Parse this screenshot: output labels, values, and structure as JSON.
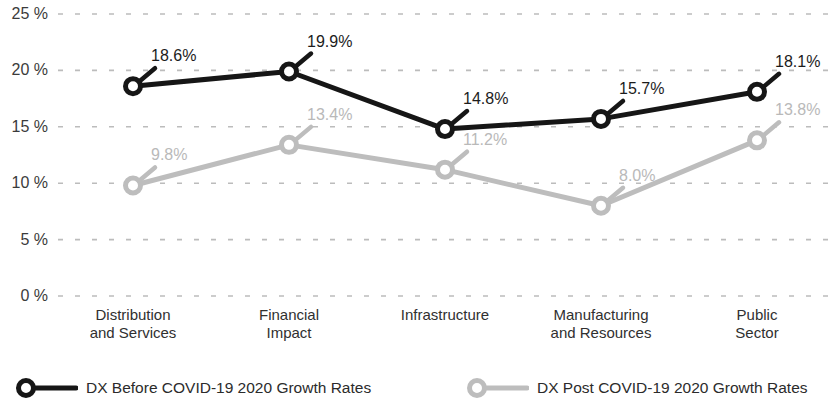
{
  "chart_data": {
    "type": "line",
    "title": "",
    "subtitle": "",
    "xlabel": "",
    "ylabel": "",
    "ylim": [
      0,
      25
    ],
    "yticks": [
      0,
      5,
      10,
      15,
      20,
      25
    ],
    "ytick_labels": [
      "0 %",
      "5 %",
      "10 %",
      "15 %",
      "20 %",
      "25 %"
    ],
    "grid": true,
    "grid_style": "dashed-horizontal",
    "legend_position": "bottom",
    "categories": [
      "Distribution\nand Services",
      "Financial\nImpact",
      "Infrastructure",
      "Manufacturing\nand Resources",
      "Public\nSector"
    ],
    "series": [
      {
        "name": "DX Before COVID-19 2020 Growth Rates",
        "color": "#161616",
        "values": [
          18.6,
          19.9,
          14.8,
          15.7,
          18.1
        ],
        "data_labels": [
          "18.6%",
          "19.9%",
          "14.8%",
          "15.7%",
          "18.1%"
        ]
      },
      {
        "name": "DX Post COVID-19 2020 Growth Rates",
        "color": "#bdbdbd",
        "values": [
          9.8,
          13.4,
          11.2,
          8.0,
          13.8
        ],
        "data_labels": [
          "9.8%",
          "13.4%",
          "11.2%",
          "8.0%",
          "13.8%"
        ]
      }
    ]
  },
  "legend": {
    "entries": [
      {
        "label": "DX Before COVID-19 2020 Growth Rates",
        "color": "#161616",
        "marker": "ring-marker"
      },
      {
        "label": "DX Post COVID-19 2020 Growth Rates",
        "color": "#bdbdbd",
        "marker": "ring-marker"
      }
    ]
  },
  "colors": {
    "series_before": "#161616",
    "series_post": "#bdbdbd",
    "grid": "#bcbcbc",
    "text": "#2b2b2b",
    "background": "#ffffff"
  }
}
